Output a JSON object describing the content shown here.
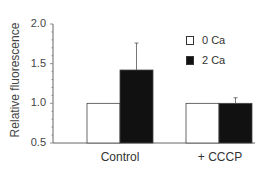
{
  "chart_data": {
    "type": "bar",
    "title": "",
    "xlabel": "",
    "ylabel": "Relative fluorescence",
    "ylim": [
      0.5,
      2.0
    ],
    "yticks": [
      "2.0",
      "1.5",
      "1.0",
      "0.5"
    ],
    "categories": [
      "Control",
      "+ CCCP"
    ],
    "series": [
      {
        "name": "0 Ca",
        "color": "#ffffff",
        "values": [
          1.0,
          1.0
        ],
        "errors": [
          0,
          0
        ]
      },
      {
        "name": "2 Ca",
        "color": "#111111",
        "values": [
          1.42,
          1.0
        ],
        "errors": [
          0.34,
          0.07
        ]
      }
    ],
    "grid": false,
    "legend_position": "upper right"
  },
  "axis": {
    "ylabel": "Relative fluorescence",
    "yticks": [
      "2.0",
      "1.5",
      "1.0",
      "0.5"
    ]
  },
  "categories": [
    "Control",
    "+ CCCP"
  ],
  "legend": [
    {
      "label": "0 Ca",
      "color": "#ffffff"
    },
    {
      "label": "2 Ca",
      "color": "#111111"
    }
  ]
}
